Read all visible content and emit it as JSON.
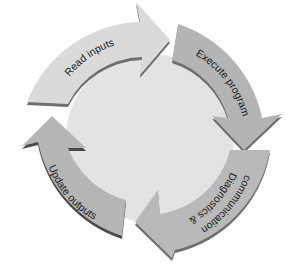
{
  "diagram": {
    "type": "cycle",
    "center_color": "#e4e4e4",
    "steps": [
      {
        "label": "Read inputs",
        "color": "#d9d9d9"
      },
      {
        "label": "Execute program",
        "color": "#b3b3b3"
      },
      {
        "label": "Diagnostics &",
        "label2": "communication",
        "color": "#b8b8b8"
      },
      {
        "label": "Update outputs",
        "color": "#b5b5b5"
      }
    ],
    "shadow_color": "#6f6f6f"
  }
}
